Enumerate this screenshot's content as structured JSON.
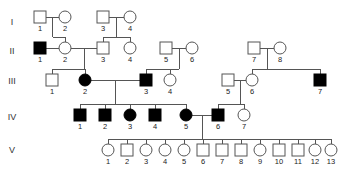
{
  "figure": {
    "kind": "pedigree-chart",
    "title": "",
    "background_color": "#ffffff",
    "line_color": "#555555",
    "affected_fill": "#000000",
    "unaffected_fill": "#ffffff",
    "label_color": "#222222"
  },
  "legend": {
    "square_meaning": "male",
    "circle_meaning": "female",
    "filled_meaning": "affected",
    "open_meaning": "unaffected"
  },
  "generations": [
    {
      "label": "I",
      "y": 23
    },
    {
      "label": "II",
      "y": 52
    },
    {
      "label": "III",
      "y": 82
    },
    {
      "label": "IV",
      "y": 118
    },
    {
      "label": "V",
      "y": 151
    }
  ],
  "individuals": [
    {
      "gen": "I",
      "id": "1",
      "sex": "male",
      "affected": false,
      "x": 40,
      "y": 17
    },
    {
      "gen": "I",
      "id": "2",
      "sex": "female",
      "affected": false,
      "x": 65,
      "y": 17
    },
    {
      "gen": "I",
      "id": "3",
      "sex": "male",
      "affected": false,
      "x": 103,
      "y": 17
    },
    {
      "gen": "I",
      "id": "4",
      "sex": "female",
      "affected": false,
      "x": 130,
      "y": 17
    },
    {
      "gen": "II",
      "id": "1",
      "sex": "male",
      "affected": true,
      "x": 40,
      "y": 48
    },
    {
      "gen": "II",
      "id": "2",
      "sex": "female",
      "affected": false,
      "x": 65,
      "y": 48
    },
    {
      "gen": "II",
      "id": "3",
      "sex": "male",
      "affected": false,
      "x": 103,
      "y": 48
    },
    {
      "gen": "II",
      "id": "4",
      "sex": "female",
      "affected": false,
      "x": 130,
      "y": 48
    },
    {
      "gen": "II",
      "id": "5",
      "sex": "male",
      "affected": false,
      "x": 166,
      "y": 48
    },
    {
      "gen": "II",
      "id": "6",
      "sex": "female",
      "affected": false,
      "x": 192,
      "y": 48
    },
    {
      "gen": "II",
      "id": "7",
      "sex": "male",
      "affected": false,
      "x": 254,
      "y": 48
    },
    {
      "gen": "II",
      "id": "8",
      "sex": "female",
      "affected": false,
      "x": 280,
      "y": 48
    },
    {
      "gen": "III",
      "id": "1",
      "sex": "male",
      "affected": false,
      "x": 52,
      "y": 80
    },
    {
      "gen": "III",
      "id": "2",
      "sex": "female",
      "affected": true,
      "x": 85,
      "y": 80
    },
    {
      "gen": "III",
      "id": "3",
      "sex": "male",
      "affected": true,
      "x": 146,
      "y": 80
    },
    {
      "gen": "III",
      "id": "4",
      "sex": "female",
      "affected": false,
      "x": 170,
      "y": 80
    },
    {
      "gen": "III",
      "id": "5",
      "sex": "male",
      "affected": false,
      "x": 228,
      "y": 80
    },
    {
      "gen": "III",
      "id": "6",
      "sex": "female",
      "affected": false,
      "x": 252,
      "y": 80
    },
    {
      "gen": "III",
      "id": "7",
      "sex": "male",
      "affected": true,
      "x": 320,
      "y": 80
    },
    {
      "gen": "IV",
      "id": "1",
      "sex": "male",
      "affected": true,
      "x": 80,
      "y": 115
    },
    {
      "gen": "IV",
      "id": "2",
      "sex": "male",
      "affected": true,
      "x": 105,
      "y": 115
    },
    {
      "gen": "IV",
      "id": "3",
      "sex": "female",
      "affected": true,
      "x": 130,
      "y": 115
    },
    {
      "gen": "IV",
      "id": "4",
      "sex": "male",
      "affected": true,
      "x": 155,
      "y": 115
    },
    {
      "gen": "IV",
      "id": "5",
      "sex": "female",
      "affected": true,
      "x": 186,
      "y": 115
    },
    {
      "gen": "IV",
      "id": "6",
      "sex": "male",
      "affected": true,
      "x": 218,
      "y": 115
    },
    {
      "gen": "IV",
      "id": "7",
      "sex": "female",
      "affected": false,
      "x": 244,
      "y": 115
    },
    {
      "gen": "V",
      "id": "1",
      "sex": "female",
      "affected": false,
      "x": 108,
      "y": 150
    },
    {
      "gen": "V",
      "id": "2",
      "sex": "male",
      "affected": false,
      "x": 127,
      "y": 150
    },
    {
      "gen": "V",
      "id": "3",
      "sex": "female",
      "affected": false,
      "x": 146,
      "y": 150
    },
    {
      "gen": "V",
      "id": "4",
      "sex": "female",
      "affected": false,
      "x": 165,
      "y": 150
    },
    {
      "gen": "V",
      "id": "5",
      "sex": "female",
      "affected": false,
      "x": 184,
      "y": 150
    },
    {
      "gen": "V",
      "id": "6",
      "sex": "male",
      "affected": false,
      "x": 203,
      "y": 150
    },
    {
      "gen": "V",
      "id": "7",
      "sex": "male",
      "affected": false,
      "x": 222,
      "y": 150
    },
    {
      "gen": "V",
      "id": "8",
      "sex": "male",
      "affected": false,
      "x": 241,
      "y": 150
    },
    {
      "gen": "V",
      "id": "9",
      "sex": "female",
      "affected": false,
      "x": 260,
      "y": 150
    },
    {
      "gen": "V",
      "id": "10",
      "sex": "male",
      "affected": false,
      "x": 279,
      "y": 150
    },
    {
      "gen": "V",
      "id": "11",
      "sex": "male",
      "affected": false,
      "x": 298,
      "y": 150
    },
    {
      "gen": "V",
      "id": "12",
      "sex": "female",
      "affected": false,
      "x": 315,
      "y": 150
    },
    {
      "gen": "V",
      "id": "13",
      "sex": "female",
      "affected": false,
      "x": 331,
      "y": 150
    }
  ],
  "matings": [
    {
      "partners": [
        "I-1",
        "I-2"
      ],
      "children": [
        "II-2"
      ]
    },
    {
      "partners": [
        "I-3",
        "I-4"
      ],
      "children": [
        "II-3",
        "II-4"
      ]
    },
    {
      "partners": [
        "II-1",
        "II-2"
      ],
      "children": []
    },
    {
      "partners": [
        "II-2",
        "II-3"
      ],
      "children": [
        "III-1",
        "III-2"
      ]
    },
    {
      "partners": [
        "II-5",
        "II-6"
      ],
      "children": [
        "III-3",
        "III-4"
      ]
    },
    {
      "partners": [
        "II-7",
        "II-8"
      ],
      "children": [
        "III-6",
        "III-7"
      ]
    },
    {
      "partners": [
        "III-2",
        "III-3"
      ],
      "children": [
        "IV-1",
        "IV-2",
        "IV-3",
        "IV-4",
        "IV-5"
      ]
    },
    {
      "partners": [
        "III-5",
        "III-6"
      ],
      "children": [
        "IV-6",
        "IV-7"
      ]
    },
    {
      "partners": [
        "IV-5",
        "IV-6"
      ],
      "children": [
        "V-1",
        "V-2",
        "V-3",
        "V-4",
        "V-5",
        "V-6",
        "V-7",
        "V-8",
        "V-9",
        "V-10",
        "V-11",
        "V-12",
        "V-13"
      ]
    }
  ],
  "counts": {
    "generation_I": 4,
    "generation_II": 8,
    "generation_III": 7,
    "generation_IV": 7,
    "generation_V": 13,
    "total_individuals": 39,
    "affected_total": 11
  }
}
